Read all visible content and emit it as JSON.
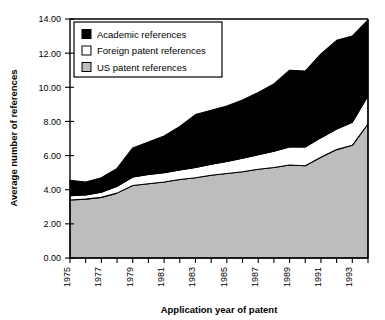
{
  "chart_data": {
    "type": "area",
    "stacked": true,
    "title": "",
    "xlabel": "Application year of patent",
    "ylabel": "Average number of references",
    "x": [
      1975,
      1976,
      1977,
      1978,
      1979,
      1980,
      1981,
      1982,
      1983,
      1984,
      1985,
      1986,
      1987,
      1988,
      1989,
      1990,
      1991,
      1992,
      1993,
      1994
    ],
    "xlim": [
      1975,
      1994
    ],
    "ylim": [
      0.0,
      14.0
    ],
    "ytick_step": 2.0,
    "yticks": [
      "0.00",
      "2.00",
      "4.00",
      "6.00",
      "8.00",
      "10.00",
      "12.00",
      "14.00"
    ],
    "xticks": [
      "1975",
      "1977",
      "1979",
      "1981",
      "1983",
      "1985",
      "1987",
      "1989",
      "1991",
      "1993"
    ],
    "xticks_all": [
      "1975",
      "1976",
      "1977",
      "1978",
      "1979",
      "1980",
      "1981",
      "1982",
      "1983",
      "1984",
      "1985",
      "1986",
      "1987",
      "1988",
      "1989",
      "1990",
      "1991",
      "1992",
      "1993",
      "1994"
    ],
    "grid": false,
    "legend_position": "top-left",
    "series": [
      {
        "name": "US patent references",
        "color": "#bdbdbd",
        "values": [
          3.4,
          3.45,
          3.55,
          3.8,
          4.25,
          4.35,
          4.45,
          4.6,
          4.7,
          4.85,
          4.95,
          5.05,
          5.2,
          5.3,
          5.45,
          5.4,
          5.9,
          6.35,
          6.6,
          7.85
        ]
      },
      {
        "name": "Foreign patent references",
        "color": "#ffffff",
        "values": [
          0.25,
          0.25,
          0.3,
          0.4,
          0.5,
          0.55,
          0.55,
          0.55,
          0.6,
          0.65,
          0.7,
          0.8,
          0.85,
          0.95,
          1.05,
          1.1,
          1.15,
          1.2,
          1.35,
          1.65
        ]
      },
      {
        "name": "Academic references",
        "color": "#000000",
        "values": [
          0.9,
          0.75,
          0.85,
          1.05,
          1.7,
          1.9,
          2.15,
          2.55,
          3.1,
          3.15,
          3.25,
          3.4,
          3.65,
          3.95,
          4.5,
          4.45,
          4.9,
          5.2,
          5.05,
          4.45
        ]
      }
    ],
    "series_totals": [
      4.55,
      4.45,
      4.7,
      5.25,
      6.45,
      6.8,
      7.15,
      7.7,
      8.4,
      8.65,
      8.9,
      9.25,
      9.7,
      10.2,
      11.0,
      10.95,
      11.95,
      12.75,
      13.0,
      13.95
    ]
  },
  "legend": {
    "items": [
      {
        "label": "Academic references",
        "swatch": "black"
      },
      {
        "label": "Foreign patent references",
        "swatch": "white"
      },
      {
        "label": "US patent references",
        "swatch": "gray"
      }
    ]
  }
}
